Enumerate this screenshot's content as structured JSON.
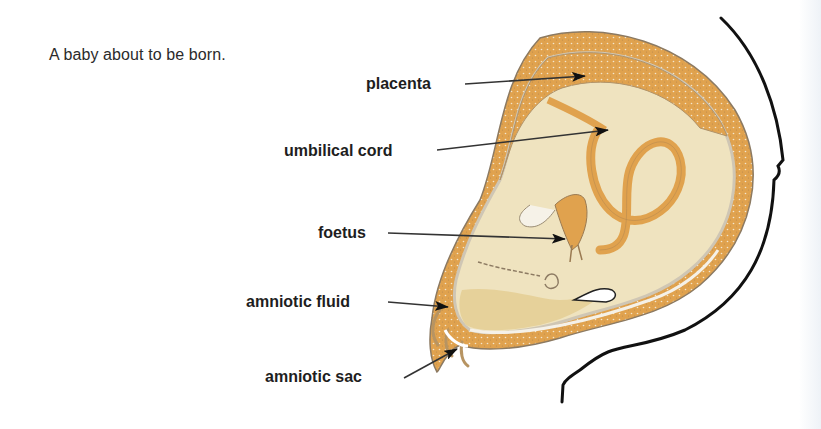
{
  "caption": "A baby about to be born.",
  "colors": {
    "tissue_orange": "#e0a24e",
    "fluid_cream": "#efe3bf",
    "fluid_dark": "#e6d19a",
    "outline": "#111111",
    "membrane": "#c9c2b4",
    "text": "#1e1e1e"
  },
  "labels": [
    {
      "id": "placenta",
      "text": "placenta"
    },
    {
      "id": "umbilical-cord",
      "text": "umbilical cord"
    },
    {
      "id": "foetus",
      "text": "foetus"
    },
    {
      "id": "amniotic-fluid",
      "text": "amniotic fluid"
    },
    {
      "id": "amniotic-sac",
      "text": "amniotic sac"
    }
  ]
}
